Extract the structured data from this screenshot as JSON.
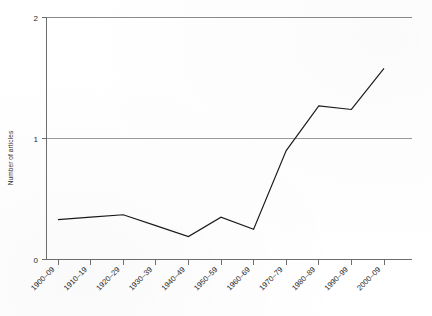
{
  "chart_data": {
    "type": "line",
    "title": "",
    "subtitle": "",
    "xlabel": "",
    "ylabel": "Number of articles",
    "categories": [
      "1900–09",
      "1910–19",
      "1920–29",
      "1930–39",
      "1940–49",
      "1950–59",
      "1960–69",
      "1970–79",
      "1980–89",
      "1990–99",
      "2000–09"
    ],
    "values": [
      0.33,
      0.35,
      0.37,
      0.28,
      0.19,
      0.35,
      0.25,
      0.9,
      1.27,
      1.24,
      1.58
    ],
    "series": [
      {
        "name": "Number of articles",
        "values": [
          0.33,
          0.35,
          0.37,
          0.28,
          0.19,
          0.35,
          0.25,
          0.9,
          1.27,
          1.24,
          1.58
        ]
      }
    ],
    "ylim": [
      0,
      2
    ],
    "y_ticks": [
      0,
      1,
      2
    ],
    "y_tick_labels": [
      "0",
      "1",
      "2"
    ],
    "grid": true,
    "gridlines_y": [
      1,
      2
    ],
    "legend": false,
    "legend_position": "none",
    "line_color": "#1a1a1a",
    "grid_color": "#8a8a8a",
    "axis_color": "#6e6e6e",
    "x_tick_label_rotation": -45,
    "markers": false,
    "annotations": []
  },
  "axes": {
    "y_title": "Number of articles",
    "y_tick_0": "0",
    "y_tick_1": "1",
    "y_tick_2": "2",
    "x_tick_0": "1900–09",
    "x_tick_1": "1910–19",
    "x_tick_2": "1920–29",
    "x_tick_3": "1930–39",
    "x_tick_4": "1940–49",
    "x_tick_5": "1950–59",
    "x_tick_6": "1960–69",
    "x_tick_7": "1970–79",
    "x_tick_8": "1980–89",
    "x_tick_9": "1990–99",
    "x_tick_10": "2000–09"
  },
  "colors": {
    "line": "#1a1a1a",
    "grid": "#8a8a8a",
    "axis": "#6e6e6e",
    "background": "#ffffff",
    "text": "#1f1f1f"
  }
}
